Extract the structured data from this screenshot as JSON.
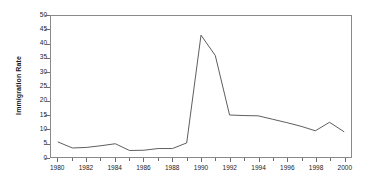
{
  "chart_data": {
    "type": "line",
    "title": "",
    "xlabel": "",
    "ylabel": "Immigration Rate",
    "xlim": [
      1979.5,
      2000.5
    ],
    "ylim": [
      0,
      50
    ],
    "grid": false,
    "legend": null,
    "y_ticks": [
      0,
      5,
      10,
      15,
      20,
      25,
      30,
      35,
      40,
      45,
      50
    ],
    "y_tick_labels": [
      "0",
      "5",
      "10",
      "15",
      "20",
      "25",
      "30",
      "35",
      "40",
      "45",
      "50"
    ],
    "x_ticks": [
      1980,
      1981,
      1982,
      1983,
      1984,
      1985,
      1986,
      1987,
      1988,
      1989,
      1990,
      1991,
      1992,
      1993,
      1994,
      1995,
      1996,
      1997,
      1998,
      1999,
      2000
    ],
    "x_tick_labels_major": [
      "1980",
      "1982",
      "1984",
      "1986",
      "1988",
      "1990",
      "1992",
      "1994",
      "1996",
      "1998",
      "2000"
    ],
    "x_major_values": [
      1980,
      1982,
      1984,
      1986,
      1988,
      1990,
      1992,
      1994,
      1996,
      1998,
      2000
    ],
    "series": [
      {
        "name": "Immigration Rate",
        "color": "#4a4a4a",
        "x": [
          1980,
          1981,
          1982,
          1983,
          1984,
          1985,
          1986,
          1987,
          1988,
          1989,
          1990,
          1991,
          1992,
          1993,
          1994,
          1995,
          1996,
          1997,
          1998,
          1999,
          2000
        ],
        "values": [
          5.3,
          3.2,
          3.4,
          4.0,
          4.7,
          2.3,
          2.4,
          3.0,
          3.0,
          5.0,
          43.2,
          36.0,
          14.9,
          14.7,
          14.6,
          13.4,
          12.2,
          10.9,
          9.3,
          12.3,
          9.0
        ]
      }
    ]
  },
  "axes": {
    "y_title": "Immigration Rate"
  }
}
